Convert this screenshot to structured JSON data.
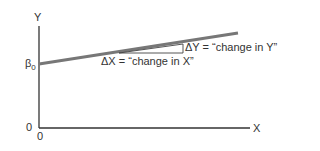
{
  "axes": {
    "y_label": "Y",
    "x_label": "X",
    "origin_y": "0",
    "origin_x": "0",
    "intercept_label": "β",
    "intercept_sub": "0"
  },
  "annotations": {
    "delta_x": "ΔX = “change in X”",
    "delta_y": "ΔY = “change in Y”"
  },
  "colors": {
    "axis": "#333333",
    "regression_line": "#777777"
  }
}
